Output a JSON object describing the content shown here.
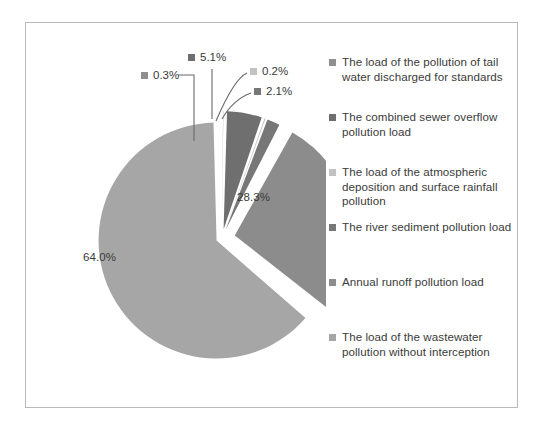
{
  "chart_data": {
    "type": "pie",
    "title": "",
    "subtitle": "",
    "xlabel": "",
    "ylabel": "",
    "legend_position": "right",
    "grid": false,
    "exploded": true,
    "categories": [
      "The load of the pollution of tail water discharged for standards",
      "The combined sewer overflow pollution load",
      "The load of the atmospheric deposition and surface rainfall pollution",
      "The river sediment pollution load",
      "Annual runoff pollution load",
      "The load of the wastewater pollution without interception"
    ],
    "values": [
      0.3,
      5.1,
      0.2,
      2.1,
      28.3,
      64.0
    ],
    "value_labels": [
      "0.3%",
      "5.1%",
      "0.2%",
      "2.1%",
      "28.3%",
      "64.0%"
    ],
    "colors": [
      "#8f8f8f",
      "#6f6f6f",
      "#c2c2c2",
      "#777777",
      "#8c8c8c",
      "#a6a6a6"
    ],
    "units": "%"
  },
  "frame": {
    "border_color": "#b9b9b9",
    "background": "#ffffff"
  },
  "pie_labels": [
    {
      "text": "0.3%",
      "swatch": "#8f8f8f",
      "left": 115,
      "top": 46
    },
    {
      "text": "5.1%",
      "swatch": "#6f6f6f",
      "left": 162,
      "top": 28
    },
    {
      "text": "0.2%",
      "swatch": "#c2c2c2",
      "left": 224,
      "top": 42
    },
    {
      "text": "2.1%",
      "swatch": "#777777",
      "left": 228,
      "top": 62
    }
  ],
  "inner_labels": [
    {
      "text": "28.3%",
      "left": 211,
      "top": 168
    },
    {
      "text": "64.0%",
      "left": 57,
      "top": 228
    }
  ],
  "legend": {
    "marker_color_default": "#8d8d8d",
    "items": [
      {
        "label": "The load of the pollution of tail water discharged for standards",
        "color": "#8f8f8f",
        "top": 10
      },
      {
        "label": "The combined sewer overflow pollution load",
        "color": "#6f6f6f",
        "top": 65
      },
      {
        "label": "The load of the atmospheric deposition and surface rainfall pollution",
        "color": "#c2c2c2",
        "top": 120
      },
      {
        "label": "The river sediment pollution load",
        "color": "#777777",
        "top": 175
      },
      {
        "label": "Annual runoff pollution load",
        "color": "#8c8c8c",
        "top": 230
      },
      {
        "label": "The load of the wastewater pollution without interception",
        "color": "#a6a6a6",
        "top": 285
      }
    ]
  }
}
